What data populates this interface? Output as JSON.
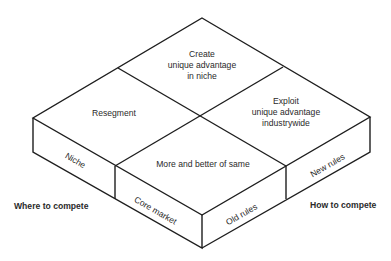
{
  "diagram": {
    "type": "isometric 2x2 strategy matrix",
    "top_face_quadrants": {
      "back": {
        "lines": [
          "Create",
          "unique advantage",
          "in niche"
        ]
      },
      "left": {
        "lines": [
          "Resegment"
        ]
      },
      "right": {
        "lines": [
          "Exploit",
          "unique advantage",
          "industrywide"
        ]
      },
      "front": {
        "lines": [
          "More and better of same"
        ]
      }
    },
    "left_side_labels": [
      "Niche",
      "Core market"
    ],
    "right_side_labels": [
      "Old rules",
      "New rules"
    ],
    "axis_labels": {
      "left": "Where to compete",
      "right": "How to compete"
    },
    "colors": {
      "line": "#1e1e1e",
      "text": "#2a2a2a",
      "background": "#ffffff"
    }
  }
}
